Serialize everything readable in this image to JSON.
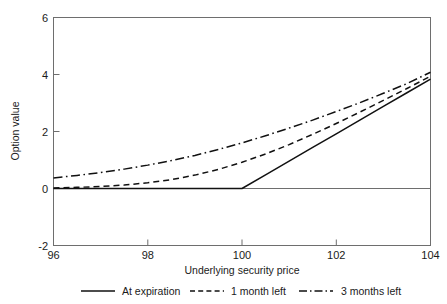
{
  "chart_data": {
    "type": "line",
    "title": "",
    "xlabel": "Underlying security price",
    "ylabel": "Option value",
    "xlim": [
      96,
      104
    ],
    "ylim": [
      -2,
      6
    ],
    "xticks": [
      "96",
      "98",
      "100",
      "102",
      "104"
    ],
    "yticks": [
      "6",
      "4",
      "2",
      "0",
      "-2"
    ],
    "grid": false,
    "legend_position": "below",
    "zero_reference_line": 0,
    "x": [
      96,
      96.5,
      97,
      97.5,
      98,
      98.5,
      99,
      99.5,
      100,
      100.5,
      101,
      101.5,
      102,
      102.5,
      103,
      103.5,
      104
    ],
    "series": [
      {
        "name": "At expiration",
        "style": "solid",
        "values": [
          0,
          0,
          0,
          0,
          0,
          0,
          0,
          0,
          0,
          0.48,
          0.96,
          1.44,
          1.92,
          2.4,
          2.88,
          3.36,
          3.84
        ]
      },
      {
        "name": "1 month left",
        "style": "dashed",
        "values": [
          0.02,
          0.04,
          0.07,
          0.12,
          0.2,
          0.31,
          0.47,
          0.67,
          0.92,
          1.21,
          1.54,
          1.9,
          2.28,
          2.68,
          3.09,
          3.51,
          3.94
        ]
      },
      {
        "name": "3 months left",
        "style": "dash-dot",
        "values": [
          0.37,
          0.46,
          0.56,
          0.68,
          0.82,
          0.98,
          1.16,
          1.37,
          1.6,
          1.85,
          2.12,
          2.4,
          2.7,
          3.01,
          3.34,
          3.68,
          4.08
        ]
      }
    ]
  },
  "legend": {
    "items": [
      {
        "label": "At expiration",
        "style": "solid"
      },
      {
        "label": "1 month left",
        "style": "dashed"
      },
      {
        "label": "3 months left",
        "style": "dash-dot"
      }
    ]
  }
}
